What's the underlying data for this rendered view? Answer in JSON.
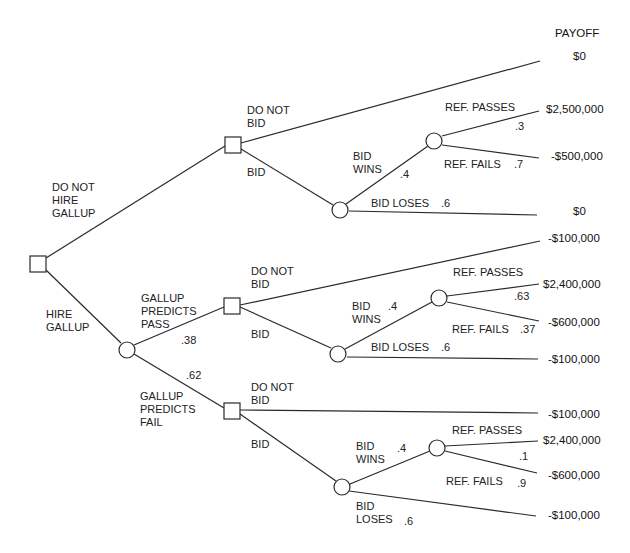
{
  "header": {
    "payoff_label": "PAYOFF"
  },
  "root": {
    "do_not_hire_label": "DO NOT\nHIRE\nGALLUP",
    "hire_label": "HIRE\nGALLUP"
  },
  "branch_no_gallup": {
    "do_not_bid_label": "DO NOT\nBID",
    "bid_label": "BID",
    "bid_wins_label": "BID\nWINS",
    "bid_wins_prob": ".4",
    "bid_loses_label": "BID LOSES",
    "bid_loses_prob": ".6",
    "ref_passes_label": "REF. PASSES",
    "ref_passes_prob": ".3",
    "ref_fails_label": "REF. FAILS",
    "ref_fails_prob": ".7",
    "payoffs": {
      "do_not_bid": "$0",
      "ref_passes": "$2,500,000",
      "ref_fails": "-$500,000",
      "bid_loses": "$0"
    }
  },
  "gallup_chance": {
    "predicts_pass_label": "GALLUP\nPREDICTS\nPASS",
    "predicts_pass_prob": ".38",
    "predicts_fail_label": "GALLUP\nPREDICTS\nFAIL",
    "predicts_fail_prob": ".62"
  },
  "branch_predicts_pass": {
    "do_not_bid_label": "DO NOT\nBID",
    "bid_label": "BID",
    "bid_wins_label": "BID\nWINS",
    "bid_wins_prob": ".4",
    "bid_loses_label": "BID LOSES",
    "bid_loses_prob": ".6",
    "ref_passes_label": "REF. PASSES",
    "ref_passes_prob": ".63",
    "ref_fails_label": "REF. FAILS",
    "ref_fails_prob": ".37",
    "payoffs": {
      "do_not_bid": "-$100,000",
      "ref_passes": "$2,400,000",
      "ref_fails": "-$600,000",
      "bid_loses": "-$100,000"
    }
  },
  "branch_predicts_fail": {
    "do_not_bid_label": "DO NOT\nBID",
    "bid_label": "BID",
    "bid_wins_label": "BID\nWINS",
    "bid_wins_prob": ".4",
    "bid_loses_label": "BID\nLOSES",
    "bid_loses_prob": ".6",
    "ref_passes_label": "REF. PASSES",
    "ref_passes_prob": ".1",
    "ref_fails_label": "REF. FAILS",
    "ref_fails_prob": ".9",
    "payoffs": {
      "do_not_bid": "-$100,000",
      "ref_passes": "$2,400,000",
      "ref_fails": "-$600,000",
      "bid_loses": "-$100,000"
    }
  }
}
